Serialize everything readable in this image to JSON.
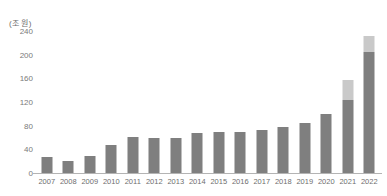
{
  "chart_data": {
    "type": "bar",
    "title": "",
    "subtitle": "",
    "unit_label": "(조 원)",
    "xlabel": "",
    "ylabel": "",
    "ylim": [
      0,
      240
    ],
    "y_ticks": [
      0,
      40,
      80,
      120,
      160,
      200,
      240
    ],
    "grid": false,
    "legend": null,
    "legend_position": "none",
    "categories": [
      "2007",
      "2008",
      "2009",
      "2010",
      "2011",
      "2012",
      "2013",
      "2014",
      "2015",
      "2016",
      "2017",
      "2018",
      "2019",
      "2020",
      "2021",
      "2022"
    ],
    "stacked": true,
    "series": [
      {
        "name": "base",
        "color": "#7f7f7f",
        "values": [
          27,
          20,
          28,
          48,
          61,
          60,
          60,
          68,
          69,
          70,
          72,
          78,
          85,
          99,
          124,
          205
        ]
      },
      {
        "name": "top",
        "color": "#c9c9c9",
        "values": [
          0,
          0,
          0,
          0,
          0,
          0,
          0,
          0,
          0,
          0,
          0,
          0,
          0,
          0,
          34,
          27
        ]
      }
    ],
    "totals": [
      27,
      20,
      28,
      48,
      61,
      60,
      60,
      68,
      69,
      70,
      72,
      78,
      85,
      99,
      158,
      232
    ]
  },
  "colors": {
    "bar_base": "#7f7f7f",
    "bar_top": "#c9c9c9",
    "axis_line": "#b4b4b4",
    "tick_text": "#6e6e6e",
    "background": "#ffffff"
  }
}
